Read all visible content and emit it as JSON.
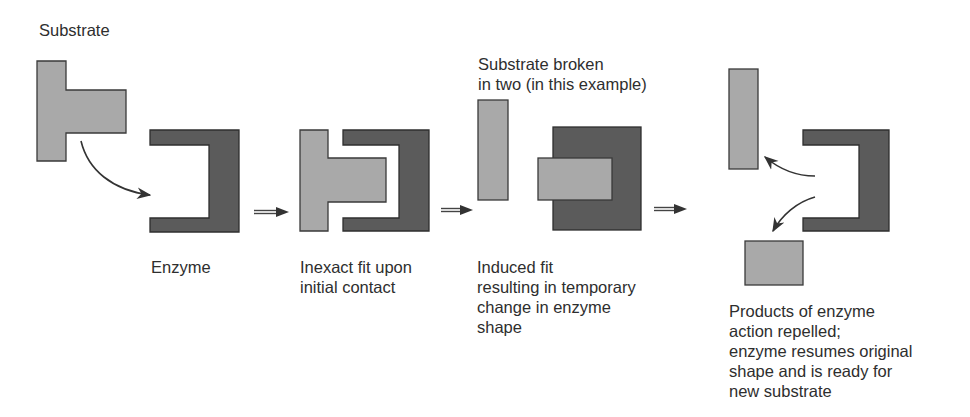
{
  "diagram": {
    "colors": {
      "substrate_fill": "#a9a9a9",
      "enzyme_fill": "#5b5b5b",
      "outline": "#333333",
      "text": "#2e2e2e",
      "background": "#ffffff"
    },
    "labels": {
      "substrate": "Substrate",
      "broken": [
        "Substrate broken",
        "in two (in this example)"
      ],
      "enzyme": "Enzyme",
      "inexact": [
        "Inexact fit upon",
        "initial contact"
      ],
      "induced": [
        "Induced fit",
        "resulting in temporary",
        "change in enzyme",
        "shape"
      ],
      "products": [
        "Products of enzyme",
        "action repelled;",
        "enzyme resumes original",
        "shape and is ready for",
        "new substrate"
      ]
    },
    "stages": [
      {
        "id": 1,
        "name": "substrate-and-enzyme",
        "caption_key": "enzyme"
      },
      {
        "id": 2,
        "name": "inexact-fit",
        "caption_key": "inexact"
      },
      {
        "id": 3,
        "name": "induced-fit",
        "caption_key": "induced"
      },
      {
        "id": 4,
        "name": "products-released",
        "caption_key": "products"
      }
    ],
    "transition_arrows": [
      "⇒",
      "⇒",
      "⇒"
    ]
  }
}
